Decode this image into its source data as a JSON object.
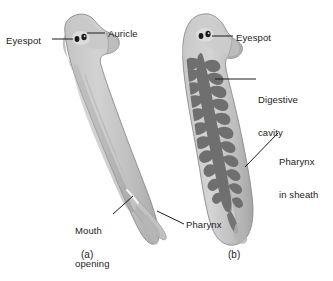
{
  "figure": {
    "background_color": "#ffffff",
    "line_color": "#1c1c1c",
    "body_fill_light": "#cfcfcf",
    "body_fill_mid": "#b3b3b3",
    "body_fill_dark": "#9a9a9a",
    "gut_fill": "#7a7a7a",
    "eyespot_color": "#1a1a1a"
  },
  "panel_a": {
    "caption": "(a)",
    "labels": {
      "eyespot": "Eyespot",
      "auricle": "Auricle",
      "mouth_opening_line1": "Mouth",
      "mouth_opening_line2": "opening",
      "pharynx": "Pharynx"
    }
  },
  "panel_b": {
    "caption": "(b)",
    "labels": {
      "eyespot": "Eyespot",
      "digestive_cavity_line1": "Digestive",
      "digestive_cavity_line2": "cavity",
      "pharynx_sheath_line1": "Pharynx",
      "pharynx_sheath_line2": "in sheath"
    }
  }
}
